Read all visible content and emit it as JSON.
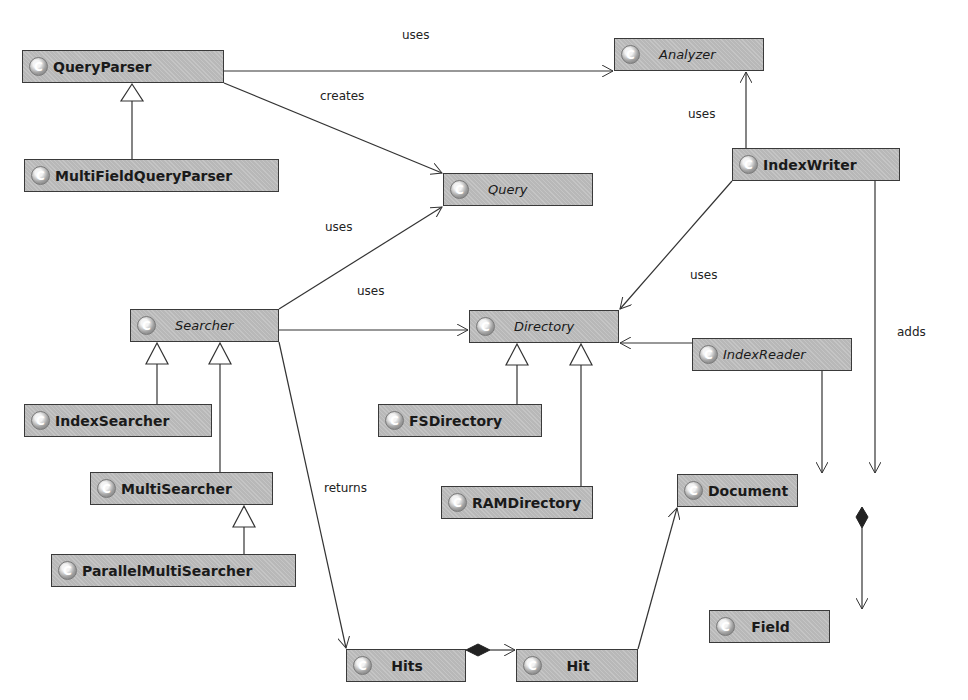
{
  "colors": {
    "class_fill": "#b8b8b8",
    "class_border": "#3a3a3a",
    "line": "#333333",
    "background": "#ffffff"
  },
  "classes": {
    "query_parser": {
      "name": "QueryParser",
      "icon": "class-c-icon"
    },
    "multi_field_query_parser": {
      "name": "MultiFieldQueryParser",
      "icon": "class-c-icon"
    },
    "analyzer": {
      "name": "Analyzer",
      "icon": "class-c-icon"
    },
    "query": {
      "name": "Query",
      "icon": "class-c-icon"
    },
    "index_writer": {
      "name": "IndexWriter",
      "icon": "class-c-icon"
    },
    "searcher": {
      "name": "Searcher",
      "icon": "class-c-icon"
    },
    "directory": {
      "name": "Directory",
      "icon": "class-c-icon"
    },
    "index_reader": {
      "name": "IndexReader",
      "icon": "class-c-icon"
    },
    "index_searcher": {
      "name": "IndexSearcher",
      "icon": "class-c-icon"
    },
    "fs_directory": {
      "name": "FSDirectory",
      "icon": "class-c-icon"
    },
    "multi_searcher": {
      "name": "MultiSearcher",
      "icon": "class-c-icon"
    },
    "ram_directory": {
      "name": "RAMDirectory",
      "icon": "class-c-icon"
    },
    "document": {
      "name": "Document",
      "icon": "class-c-icon"
    },
    "parallel_multi_searcher": {
      "name": "ParallelMultiSearcher",
      "icon": "class-c-icon"
    },
    "field": {
      "name": "Field",
      "icon": "class-c-icon"
    },
    "hits": {
      "name": "Hits",
      "icon": "class-c-icon"
    },
    "hit": {
      "name": "Hit",
      "icon": "class-c-icon"
    }
  },
  "icon_glyph": "C",
  "labels": {
    "parser_uses_analyzer": "uses",
    "parser_creates_query": "creates",
    "writer_uses_analyzer": "uses",
    "searcher_uses_query": "uses",
    "searcher_uses_directory": "uses",
    "writer_uses_directory": "uses",
    "writer_adds_document": "adds",
    "searcher_returns_hits": "returns"
  },
  "relationships": [
    {
      "from": "QueryParser",
      "to": "Analyzer",
      "type": "association",
      "label": "uses"
    },
    {
      "from": "QueryParser",
      "to": "Query",
      "type": "association",
      "label": "creates"
    },
    {
      "from": "MultiFieldQueryParser",
      "to": "QueryParser",
      "type": "generalization"
    },
    {
      "from": "IndexWriter",
      "to": "Analyzer",
      "type": "association",
      "label": "uses"
    },
    {
      "from": "IndexWriter",
      "to": "Directory",
      "type": "association",
      "label": "uses"
    },
    {
      "from": "IndexWriter",
      "to": "Document",
      "type": "association",
      "label": "adds"
    },
    {
      "from": "Searcher",
      "to": "Query",
      "type": "association",
      "label": "uses"
    },
    {
      "from": "Searcher",
      "to": "Directory",
      "type": "association",
      "label": "uses"
    },
    {
      "from": "Searcher",
      "to": "Hits",
      "type": "association",
      "label": "returns"
    },
    {
      "from": "IndexSearcher",
      "to": "Searcher",
      "type": "generalization"
    },
    {
      "from": "MultiSearcher",
      "to": "Searcher",
      "type": "generalization"
    },
    {
      "from": "ParallelMultiSearcher",
      "to": "MultiSearcher",
      "type": "generalization"
    },
    {
      "from": "FSDirectory",
      "to": "Directory",
      "type": "generalization"
    },
    {
      "from": "RAMDirectory",
      "to": "Directory",
      "type": "generalization"
    },
    {
      "from": "IndexReader",
      "to": "Directory",
      "type": "association"
    },
    {
      "from": "IndexReader",
      "to": "Document",
      "type": "association"
    },
    {
      "from": "Document",
      "to": "Field",
      "type": "composition"
    },
    {
      "from": "Hits",
      "to": "Hit",
      "type": "composition"
    },
    {
      "from": "Hit",
      "to": "Document",
      "type": "association"
    }
  ]
}
